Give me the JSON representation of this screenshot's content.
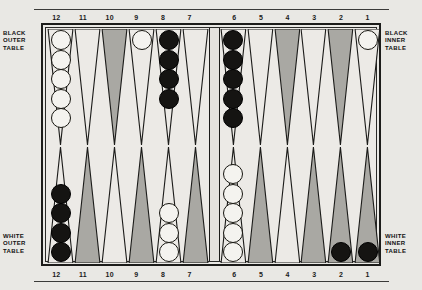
{
  "board": {
    "title": "Backgammon board diagram",
    "colors": {
      "page_background": "#e9e8e4",
      "board_background": "#eceae6",
      "frame_line": "#1c1c1a",
      "shaded_point": "#a9a8a3",
      "light_point": "#eceae6",
      "white_checker": "#f4f3ef",
      "black_checker": "#151412"
    },
    "labels": {
      "black_outer": [
        "BLACK",
        "OUTER",
        "TABLE"
      ],
      "black_inner": [
        "BLACK",
        "INNER",
        "TABLE"
      ],
      "white_outer": [
        "WHITE",
        "OUTER",
        "TABLE"
      ],
      "white_inner": [
        "WHITE",
        "INNER",
        "TABLE"
      ]
    },
    "point_numbers": {
      "top_left": [
        "12",
        "11",
        "10",
        "9",
        "8",
        "7"
      ],
      "top_right": [
        "6",
        "5",
        "4",
        "3",
        "2",
        "1"
      ],
      "bottom_left": [
        "12",
        "11",
        "10",
        "9",
        "8",
        "7"
      ],
      "bottom_right": [
        "6",
        "5",
        "4",
        "3",
        "2",
        "1"
      ]
    },
    "quadrants": {
      "top_left": {
        "name": "black-outer-table",
        "points": [
          {
            "number": "12",
            "shade": "light",
            "checkers": 5,
            "color": "white"
          },
          {
            "number": "11",
            "shade": "light",
            "checkers": 0,
            "color": "none"
          },
          {
            "number": "10",
            "shade": "shaded",
            "checkers": 0,
            "color": "none"
          },
          {
            "number": "9",
            "shade": "light",
            "checkers": 1,
            "color": "white"
          },
          {
            "number": "8",
            "shade": "light",
            "checkers": 4,
            "color": "black"
          },
          {
            "number": "7",
            "shade": "light",
            "checkers": 0,
            "color": "none"
          }
        ]
      },
      "top_right": {
        "name": "black-inner-table",
        "points": [
          {
            "number": "6",
            "shade": "light",
            "checkers": 5,
            "color": "black"
          },
          {
            "number": "5",
            "shade": "light",
            "checkers": 0,
            "color": "none"
          },
          {
            "number": "4",
            "shade": "shaded",
            "checkers": 0,
            "color": "none"
          },
          {
            "number": "3",
            "shade": "light",
            "checkers": 0,
            "color": "none"
          },
          {
            "number": "2",
            "shade": "shaded",
            "checkers": 0,
            "color": "none"
          },
          {
            "number": "1",
            "shade": "light",
            "checkers": 1,
            "color": "white"
          }
        ]
      },
      "bottom_left": {
        "name": "white-outer-table",
        "points": [
          {
            "number": "12",
            "shade": "light",
            "checkers": 4,
            "color": "black"
          },
          {
            "number": "11",
            "shade": "shaded",
            "checkers": 0,
            "color": "none"
          },
          {
            "number": "10",
            "shade": "light",
            "checkers": 0,
            "color": "none"
          },
          {
            "number": "9",
            "shade": "shaded",
            "checkers": 0,
            "color": "none"
          },
          {
            "number": "8",
            "shade": "light",
            "checkers": 3,
            "color": "white"
          },
          {
            "number": "7",
            "shade": "shaded",
            "checkers": 0,
            "color": "none"
          }
        ]
      },
      "bottom_right": {
        "name": "white-inner-table",
        "points": [
          {
            "number": "6",
            "shade": "light",
            "checkers": 5,
            "color": "white"
          },
          {
            "number": "5",
            "shade": "shaded",
            "checkers": 0,
            "color": "none"
          },
          {
            "number": "4",
            "shade": "light",
            "checkers": 0,
            "color": "none"
          },
          {
            "number": "3",
            "shade": "shaded",
            "checkers": 0,
            "color": "none"
          },
          {
            "number": "2",
            "shade": "shaded",
            "checkers": 1,
            "color": "black"
          },
          {
            "number": "1",
            "shade": "shaded",
            "checkers": 1,
            "color": "black"
          }
        ]
      }
    }
  }
}
